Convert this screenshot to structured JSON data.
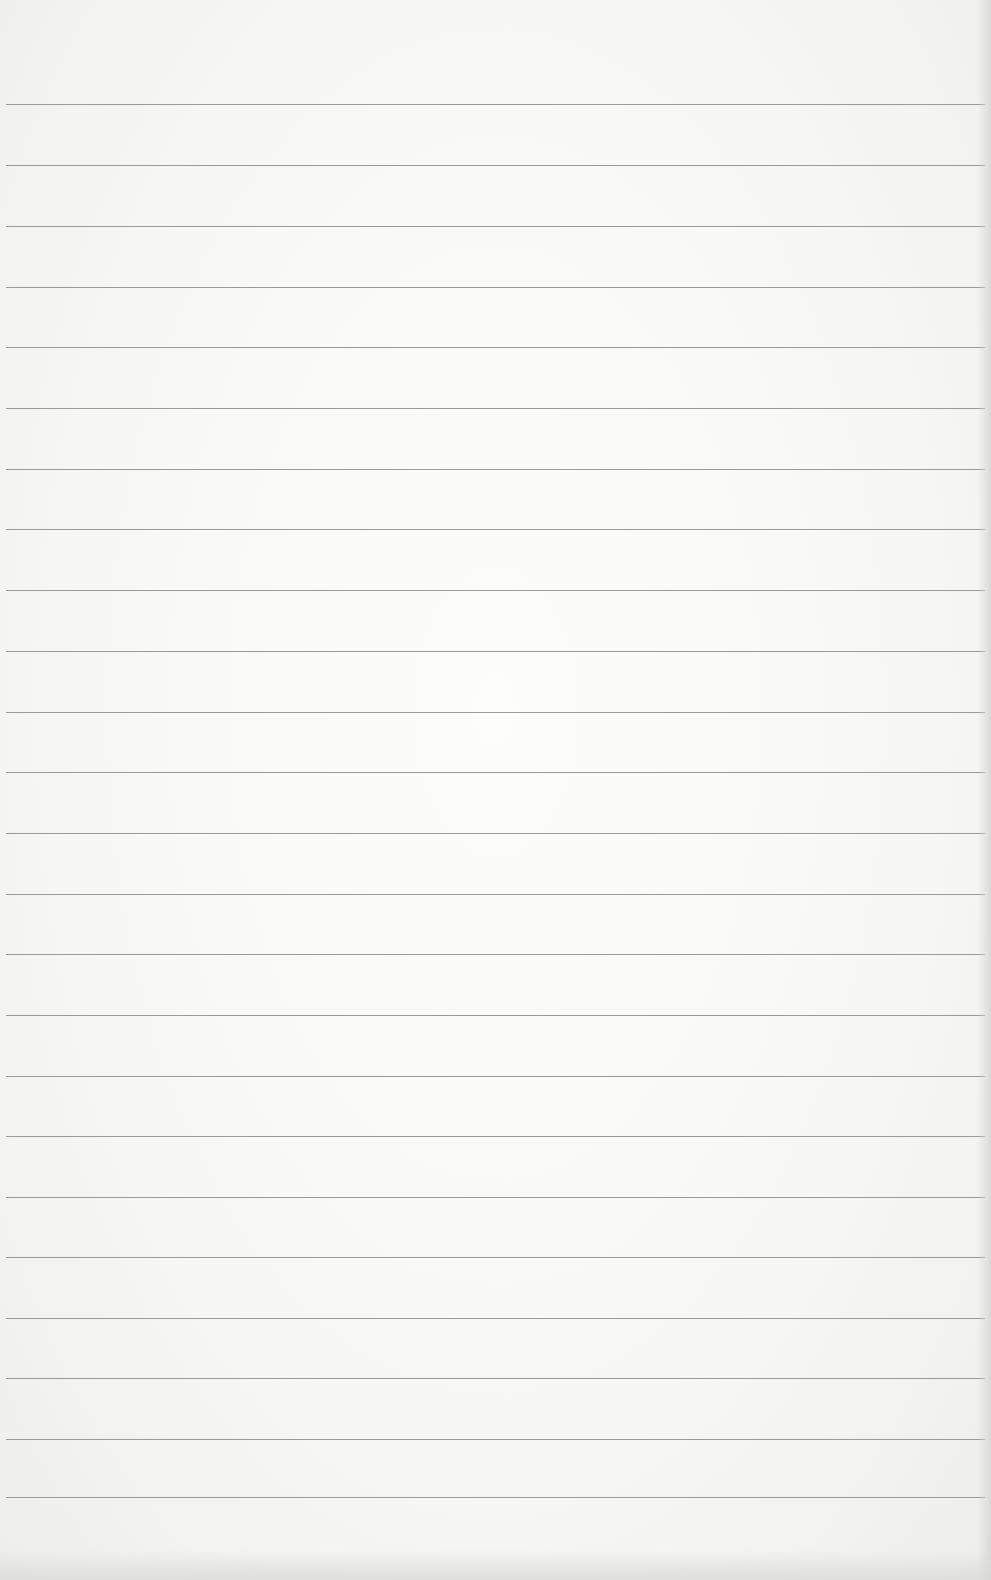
{
  "paper": {
    "kind": "lined-paper",
    "background_color": "#f7f7f5",
    "rule_color": "#8a8a88",
    "rule_count": 24,
    "rule_positions_y": [
      104,
      165,
      226,
      287,
      347,
      408,
      469,
      529,
      590,
      651,
      712,
      772,
      833,
      894,
      954,
      1015,
      1076,
      1136,
      1197,
      1257,
      1318,
      1378,
      1439,
      1497
    ]
  }
}
